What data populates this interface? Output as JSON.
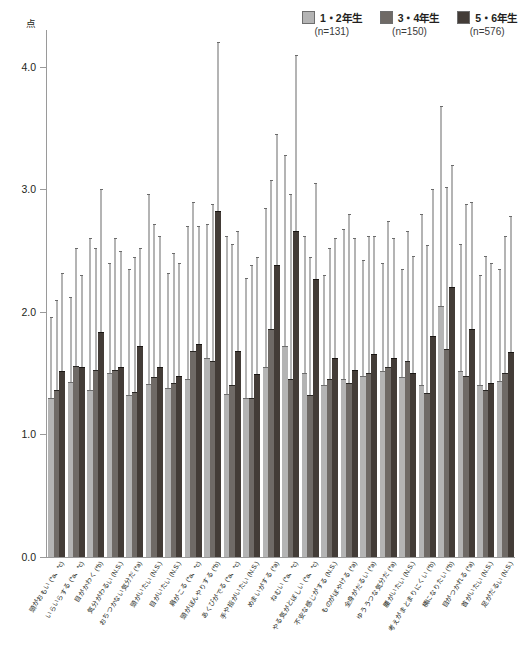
{
  "unit_label": "点",
  "legend": [
    {
      "label": "1・2年生",
      "n": "(n=131)",
      "color": "#b4b4b4",
      "icon": "legend-swatch-icon"
    },
    {
      "label": "3・4年生",
      "n": "(n=150)",
      "color": "#6f6a66",
      "icon": "legend-swatch-icon"
    },
    {
      "label": "5・6年生",
      "n": "(n=576)",
      "color": "#433c37",
      "icon": "legend-swatch-icon"
    }
  ],
  "chart_data": {
    "type": "bar",
    "title": "",
    "subtitle": "",
    "xlabel": "",
    "ylabel": "点",
    "ylim": [
      0.0,
      4.3
    ],
    "yticks": [
      "0.0",
      "1.0",
      "2.0",
      "3.0",
      "4.0"
    ],
    "ytick_values": [
      0.0,
      1.0,
      2.0,
      3.0,
      4.0
    ],
    "grid": false,
    "legend_position": "top-right",
    "error_bars": "upper SD whiskers only",
    "categories": [
      "頭がおもい (*a、*c)",
      "いらいらする (*a、*c)",
      "目がかわく (*b)",
      "気分がわるい (N.S.)",
      "おちつかない気分だ (*a)",
      "頭がいたい (N.S.)",
      "目がいたい (N.S.)",
      "肩がこる (*a、*c)",
      "頭がぼんやりする (*b)",
      "あくびがでる (*a、*c)",
      "手や指がいたい (N.S.)",
      "めまいがする (*a)",
      "ねむい (*a、*c)",
      "やる気がとぼしい (*a、*c)",
      "不安な感じがする (N.S.)",
      "ものがぼやける (*a)",
      "全身がだるい (*a)",
      "ゆううつな気分だ (*a)",
      "腰がいたい (N.S.)",
      "考えがまとまりにくい (*b)",
      "横になりたい (*b)",
      "目がつかれる (*a)",
      "首がいたい (N.S.)",
      "足がだるい (N.S.)"
    ],
    "series": [
      {
        "name": "1・2年生",
        "n": 131,
        "color": "#b4b4b4",
        "values": [
          1.3,
          1.43,
          1.36,
          1.5,
          1.32,
          1.41,
          1.38,
          1.45,
          1.62,
          1.33,
          1.3,
          1.55,
          1.72,
          1.5,
          1.4,
          1.45,
          1.48,
          1.52,
          1.47,
          1.4,
          2.05,
          1.52,
          1.4,
          1.44
        ],
        "err_upper": [
          1.96,
          2.12,
          2.6,
          2.4,
          2.35,
          2.96,
          2.32,
          2.7,
          2.72,
          2.62,
          2.28,
          2.85,
          3.28,
          2.62,
          2.3,
          2.68,
          2.42,
          2.4,
          2.35,
          2.8,
          3.68,
          2.55,
          2.3,
          2.35
        ]
      },
      {
        "name": "3・4年生",
        "n": 150,
        "color": "#6f6a66",
        "values": [
          1.36,
          1.56,
          1.53,
          1.53,
          1.35,
          1.47,
          1.42,
          1.68,
          1.6,
          1.4,
          1.3,
          1.86,
          1.45,
          1.32,
          1.45,
          1.42,
          1.5,
          1.55,
          1.6,
          1.34,
          1.7,
          1.48,
          1.36,
          1.5
        ],
        "err_upper": [
          2.1,
          2.52,
          2.52,
          2.6,
          2.45,
          2.72,
          2.48,
          2.9,
          2.88,
          2.55,
          2.38,
          3.08,
          2.96,
          2.45,
          2.52,
          2.8,
          2.62,
          2.74,
          2.66,
          2.55,
          3.02,
          2.88,
          2.46,
          2.62
        ]
      },
      {
        "name": "5・6年生",
        "n": 576,
        "color": "#433c37",
        "values": [
          1.52,
          1.55,
          1.84,
          1.55,
          1.72,
          1.55,
          1.48,
          1.74,
          2.82,
          1.68,
          1.49,
          2.38,
          2.66,
          2.27,
          1.62,
          1.53,
          1.66,
          1.62,
          1.5,
          1.8,
          2.2,
          1.86,
          1.42,
          1.67
        ]
      }
    ],
    "series3_err_upper": [
      2.32,
      2.3,
      3.0,
      2.5,
      2.52,
      2.62,
      2.4,
      2.7,
      4.2,
      2.66,
      2.45,
      3.45,
      4.1,
      3.05,
      2.6,
      2.6,
      2.62,
      2.6,
      2.46,
      3.0,
      3.2,
      2.9,
      2.4,
      2.78
    ]
  }
}
